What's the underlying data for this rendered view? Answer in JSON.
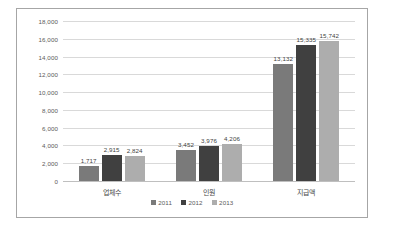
{
  "chart_data": {
    "type": "bar",
    "title": "",
    "subtitle": "",
    "xlabel": "",
    "ylabel": "",
    "categories": [
      "업체수",
      "인원",
      "지급액"
    ],
    "series": [
      {
        "name": "2011",
        "values": [
          1717,
          3452,
          13132
        ],
        "color": "#7a7a7a"
      },
      {
        "name": "2012",
        "values": [
          2915,
          3976,
          15335
        ],
        "color": "#404040"
      },
      {
        "name": "2013",
        "values": [
          2824,
          4206,
          15742
        ],
        "color": "#adadad"
      }
    ],
    "value_labels": [
      [
        "1,717",
        "2,915",
        "2,824"
      ],
      [
        "3,452",
        "3,976",
        "4,206"
      ],
      [
        "13,132",
        "15,335",
        "15,742"
      ]
    ],
    "ylim": [
      0,
      18000
    ],
    "ytick_values": [
      0,
      2000,
      4000,
      6000,
      8000,
      10000,
      12000,
      14000,
      16000,
      18000
    ],
    "ytick_labels": [
      "0",
      "2,000",
      "4,000",
      "6,000",
      "8,000",
      "10,000",
      "12,000",
      "14,000",
      "16,000",
      "18,000"
    ],
    "grid": true,
    "legend_position": "bottom",
    "legend_marker": "■",
    "frame_border_color": "#a6a6a6",
    "gridline_color": "#d9d9d9",
    "background": "#ffffff"
  }
}
